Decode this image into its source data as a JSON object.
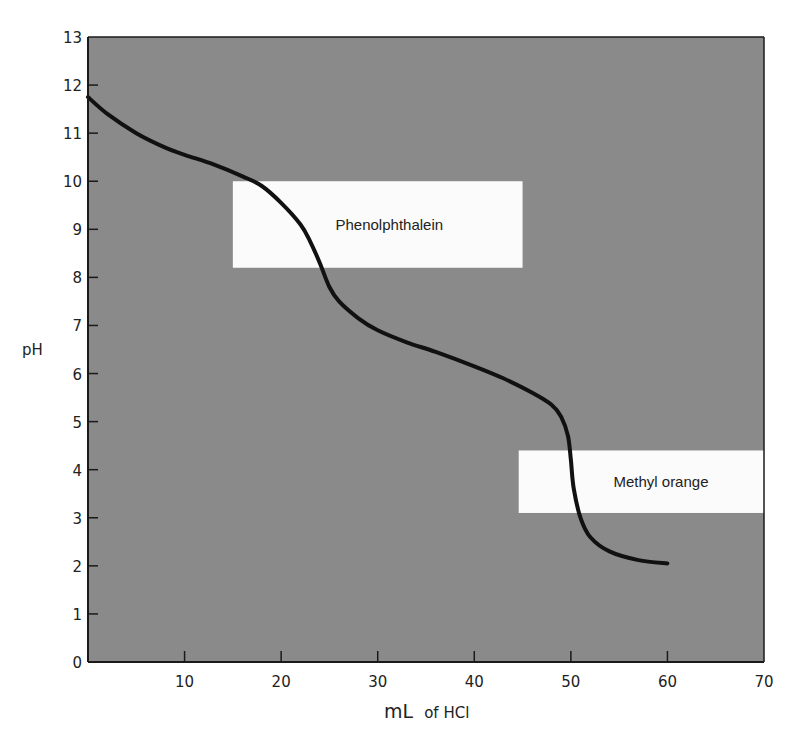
{
  "chart_data": {
    "type": "line",
    "title": "",
    "xlabel": "mL of HCl",
    "xlabel_main": "mL",
    "xlabel_sub": "of HCl",
    "ylabel": "pH",
    "xlim": [
      0,
      70
    ],
    "ylim": [
      0,
      13
    ],
    "x_ticks": [
      10,
      20,
      30,
      40,
      50,
      60,
      70
    ],
    "y_ticks": [
      0,
      1,
      2,
      3,
      4,
      5,
      6,
      7,
      8,
      9,
      10,
      11,
      12,
      13
    ],
    "grid": false,
    "legend": null,
    "background_color": "#8a8a8a",
    "line_color": "#111111",
    "series": [
      {
        "name": "Titration curve (pH vs mL HCl)",
        "x": [
          0,
          2,
          5,
          8,
          10,
          13,
          16,
          18,
          20,
          22,
          23,
          24,
          25,
          26,
          28,
          30,
          33,
          36,
          40,
          43,
          46,
          48,
          49,
          49.7,
          50,
          50.3,
          51,
          52,
          54,
          57,
          60
        ],
        "y": [
          11.75,
          11.4,
          11.0,
          10.7,
          10.55,
          10.35,
          10.1,
          9.9,
          9.55,
          9.1,
          8.75,
          8.3,
          7.8,
          7.5,
          7.15,
          6.9,
          6.65,
          6.45,
          6.15,
          5.9,
          5.6,
          5.35,
          5.1,
          4.7,
          4.2,
          3.6,
          3.0,
          2.6,
          2.3,
          2.12,
          2.05
        ]
      }
    ],
    "annotations": [
      {
        "label": "Phenolphthalein",
        "type": "indicator_range",
        "x_range": [
          15,
          45
        ],
        "y_range": [
          8.2,
          10.0
        ],
        "fill": "#fbfbfb"
      },
      {
        "label": "Methyl orange",
        "type": "indicator_range",
        "x_range": [
          44.6,
          70
        ],
        "y_range": [
          3.1,
          4.4
        ],
        "fill": "#fbfbfb"
      }
    ]
  }
}
